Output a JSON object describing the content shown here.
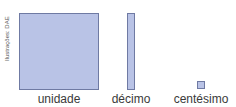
{
  "credit": "Ilustrações: DAE",
  "colors": {
    "fill": "#b9c3e6",
    "border": "#6f7aa3",
    "label": "#3a3a3a"
  },
  "figures": [
    {
      "id": "unit",
      "label": "unidade"
    },
    {
      "id": "tenth",
      "label": "décimo"
    },
    {
      "id": "hundredth",
      "label": "centésimo"
    }
  ]
}
